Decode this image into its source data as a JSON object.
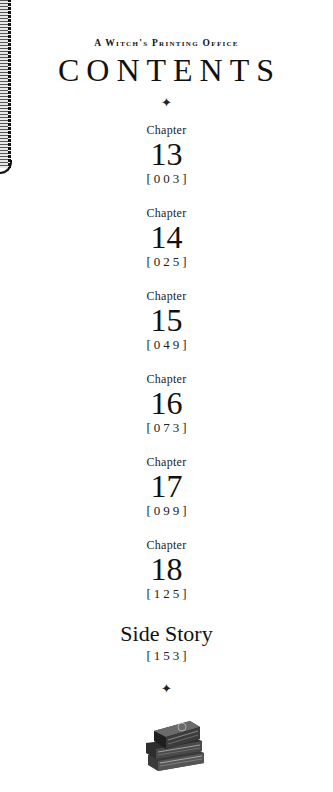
{
  "page": {
    "subtitle": "A Witch's Printing Office",
    "title": "CONTENTS",
    "ornament_top": "✦",
    "ornament_bottom": "✦"
  },
  "chapters": [
    {
      "label": "Chapter",
      "number": "13",
      "page": "[003]"
    },
    {
      "label": "Chapter",
      "number": "14",
      "page": "[025]"
    },
    {
      "label": "Chapter",
      "number": "15",
      "page": "[049]"
    },
    {
      "label": "Chapter",
      "number": "16",
      "page": "[073]"
    },
    {
      "label": "Chapter",
      "number": "17",
      "page": "[099]"
    },
    {
      "label": "Chapter",
      "number": "18",
      "page": "[125]"
    }
  ],
  "side_story": {
    "title": "Side Story",
    "page": "[153]"
  },
  "illustration": "stacked-books"
}
